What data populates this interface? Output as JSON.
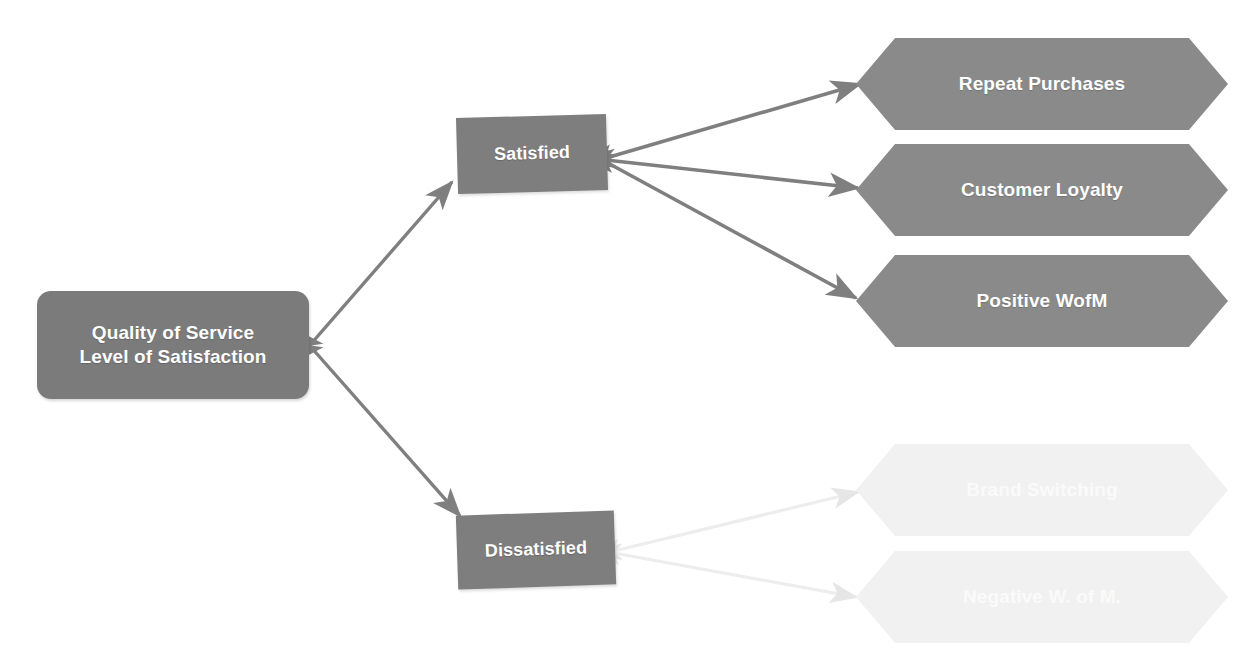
{
  "diagram": {
    "colors": {
      "root_fill": "#7b7b7b",
      "stage_fill": "#7e7e7e",
      "outcome_fill": "#8a8a8a",
      "faded_outcome_fill": "#f1f1f1",
      "arrow_strong": "#7f7f7f",
      "arrow_faded": "#ededed",
      "node_text": "#ffffff",
      "background": "#ffffff"
    },
    "root": {
      "id": "quality-of-service",
      "line1": "Quality of Service",
      "line2": "Level of Satisfaction",
      "shape": "rounded-rectangle"
    },
    "stages": [
      {
        "id": "satisfied",
        "label": "Satisfied",
        "shape": "rectangle",
        "state": "strong"
      },
      {
        "id": "dissatisfied",
        "label": "Dissatisfied",
        "shape": "rectangle",
        "state": "strong"
      }
    ],
    "outcomes": [
      {
        "id": "repeat-purchases",
        "label": "Repeat Purchases",
        "shape": "hexagon",
        "state": "strong",
        "from": "satisfied"
      },
      {
        "id": "customer-loyalty",
        "label": "Customer Loyalty",
        "shape": "hexagon",
        "state": "strong",
        "from": "satisfied"
      },
      {
        "id": "positive-wofm",
        "label": "Positive WofM",
        "shape": "hexagon",
        "state": "strong",
        "from": "satisfied"
      },
      {
        "id": "brand-switching",
        "label": "Brand Switching",
        "shape": "hexagon",
        "state": "faded",
        "from": "dissatisfied"
      },
      {
        "id": "negative-w-of-m",
        "label": "Negative W. of M.",
        "shape": "hexagon",
        "state": "faded",
        "from": "dissatisfied"
      }
    ],
    "connectors": [
      {
        "id": "root-to-satisfied",
        "from": "quality-of-service",
        "to": "satisfied",
        "style": "strong",
        "arrow": "double"
      },
      {
        "id": "root-to-dissatisfied",
        "from": "quality-of-service",
        "to": "dissatisfied",
        "style": "strong",
        "arrow": "double"
      },
      {
        "id": "satisfied-to-repeat-purchases",
        "from": "satisfied",
        "to": "repeat-purchases",
        "style": "strong",
        "arrow": "double"
      },
      {
        "id": "satisfied-to-customer-loyalty",
        "from": "satisfied",
        "to": "customer-loyalty",
        "style": "strong",
        "arrow": "double"
      },
      {
        "id": "satisfied-to-positive-wofm",
        "from": "satisfied",
        "to": "positive-wofm",
        "style": "strong",
        "arrow": "double"
      },
      {
        "id": "dissatisfied-to-brand-switching",
        "from": "dissatisfied",
        "to": "brand-switching",
        "style": "faded",
        "arrow": "double"
      },
      {
        "id": "dissatisfied-to-negative-w-of-m",
        "from": "dissatisfied",
        "to": "negative-w-of-m",
        "style": "faded",
        "arrow": "double"
      }
    ]
  }
}
